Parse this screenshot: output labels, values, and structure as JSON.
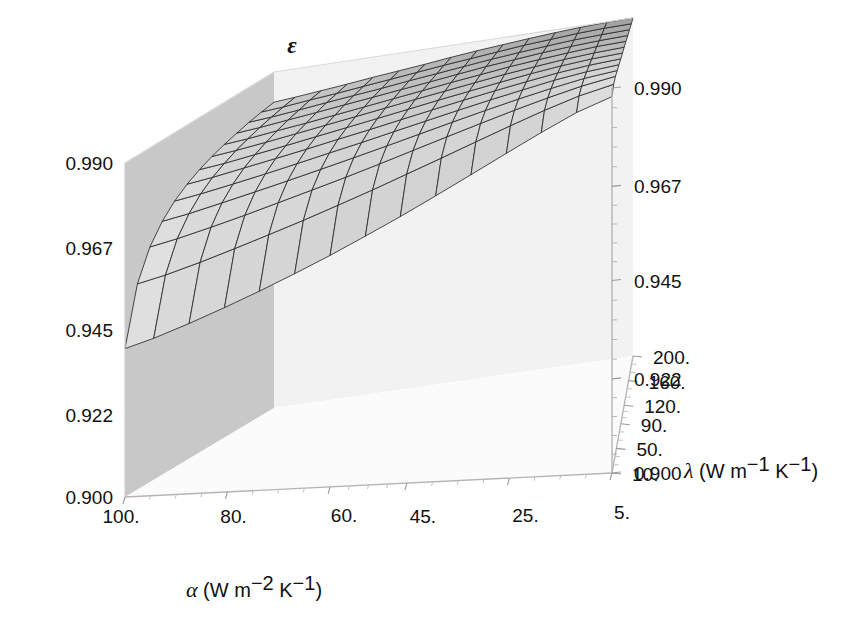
{
  "figure": {
    "kind": "surface-plot-3d",
    "background": "#ffffff",
    "ink": "#111111"
  },
  "vertical_axis": {
    "name": "epsilon",
    "label": "ε",
    "ticks_left": [
      "0.990",
      "0.967",
      "0.945",
      "0.922",
      "0.900"
    ],
    "ticks_right": [
      "0.990",
      "0.967",
      "0.945",
      "0.922",
      "0.900"
    ]
  },
  "alpha_axis": {
    "label_symbol": "α",
    "label_unit_open": " (W m",
    "label_unit_sup1": "−2",
    "label_unit_mid": " K",
    "label_unit_sup2": "−1",
    "label_unit_close": ")",
    "label_full": "α (W m−2 K−1)",
    "ticks": [
      "100.",
      "80.",
      "60.",
      "45.",
      "25.",
      "5."
    ]
  },
  "lambda_axis": {
    "label_symbol": "λ",
    "label_unit_open": " (W m",
    "label_unit_sup1": "−1",
    "label_unit_mid": " K",
    "label_unit_sup2": "−1",
    "label_unit_close": ")",
    "label_full": "λ (W m−1 K−1)",
    "ticks": [
      "200.",
      "160.",
      "120.",
      "90.",
      "50.",
      "10."
    ]
  },
  "chart_data": {
    "type": "surface",
    "title": "",
    "xlabel": "α (W m−2 K−1)",
    "ylabel": "λ (W m−1 K−1)",
    "zlabel": "ε",
    "xlim": [
      5,
      100
    ],
    "ylim": [
      10,
      200
    ],
    "zlim": [
      0.9,
      0.99
    ],
    "grid": true,
    "legend": "none",
    "colormap": "grayscale",
    "x_ticks": [
      100,
      80,
      60,
      45,
      25,
      5
    ],
    "y_ticks": [
      200,
      160,
      120,
      90,
      50,
      10
    ],
    "z_ticks": [
      0.99,
      0.967,
      0.945,
      0.922,
      0.9
    ],
    "x_name": "alpha",
    "y_name": "lambda",
    "z_name": "epsilon",
    "mesh_nx": 17,
    "mesh_ny": 13,
    "note": "epsilon rises toward high lambda and low alpha; steep drop at low lambda / high alpha corner",
    "x": [
      5,
      11.9,
      18.8,
      25.6,
      32.5,
      39.4,
      46.3,
      53.1,
      60,
      66.9,
      73.8,
      80.6,
      87.5,
      94.4,
      100
    ],
    "y": [
      10,
      25.8,
      41.7,
      57.5,
      73.3,
      89.2,
      105,
      120.8,
      136.7,
      152.5,
      168.3,
      184.2,
      200
    ],
    "z": [
      [
        0.988,
        0.9855,
        0.982,
        0.9782,
        0.9742,
        0.9702,
        0.9662,
        0.9624,
        0.9586,
        0.955,
        0.9515,
        0.9482,
        0.945,
        0.942,
        0.94
      ],
      [
        0.9895,
        0.988,
        0.9858,
        0.9833,
        0.9806,
        0.9778,
        0.975,
        0.9722,
        0.9695,
        0.9668,
        0.9642,
        0.9617,
        0.9592,
        0.9569,
        0.9554
      ],
      [
        0.99,
        0.9889,
        0.9873,
        0.9855,
        0.9835,
        0.9814,
        0.9792,
        0.977,
        0.9748,
        0.9727,
        0.9706,
        0.9685,
        0.9665,
        0.9646,
        0.9633
      ],
      [
        0.99,
        0.9893,
        0.9881,
        0.9867,
        0.9851,
        0.9834,
        0.9816,
        0.9798,
        0.978,
        0.9762,
        0.9744,
        0.9727,
        0.971,
        0.9693,
        0.9682
      ],
      [
        0.99,
        0.9895,
        0.9886,
        0.9874,
        0.9861,
        0.9847,
        0.9832,
        0.9817,
        0.9801,
        0.9786,
        0.977,
        0.9755,
        0.974,
        0.9726,
        0.9716
      ],
      [
        0.99,
        0.9896,
        0.9889,
        0.9879,
        0.9868,
        0.9856,
        0.9843,
        0.983,
        0.9816,
        0.9803,
        0.9789,
        0.9776,
        0.9763,
        0.975,
        0.9741
      ],
      [
        0.99,
        0.9897,
        0.9891,
        0.9883,
        0.9873,
        0.9862,
        0.9851,
        0.9839,
        0.9827,
        0.9815,
        0.9803,
        0.9791,
        0.9779,
        0.9767,
        0.976
      ],
      [
        0.99,
        0.9897,
        0.9892,
        0.9885,
        0.9877,
        0.9867,
        0.9857,
        0.9847,
        0.9836,
        0.9825,
        0.9814,
        0.9803,
        0.9792,
        0.9782,
        0.9775
      ],
      [
        0.99,
        0.9898,
        0.9893,
        0.9887,
        0.988,
        0.9871,
        0.9862,
        0.9852,
        0.9842,
        0.9832,
        0.9822,
        0.9812,
        0.9803,
        0.9793,
        0.9787
      ],
      [
        0.99,
        0.9898,
        0.9894,
        0.9889,
        0.9882,
        0.9875,
        0.9866,
        0.9857,
        0.9848,
        0.9839,
        0.983,
        0.9821,
        0.9812,
        0.9803,
        0.9797
      ],
      [
        0.99,
        0.9898,
        0.9895,
        0.989,
        0.9884,
        0.9877,
        0.9869,
        0.9861,
        0.9853,
        0.9844,
        0.9836,
        0.9828,
        0.9819,
        0.9811,
        0.9806
      ],
      [
        0.99,
        0.9899,
        0.9896,
        0.9891,
        0.9886,
        0.9879,
        0.9872,
        0.9865,
        0.9857,
        0.9849,
        0.9841,
        0.9833,
        0.9826,
        0.9818,
        0.9813
      ],
      [
        0.99,
        0.9899,
        0.9896,
        0.9892,
        0.9887,
        0.9881,
        0.9875,
        0.9868,
        0.986,
        0.9853,
        0.9846,
        0.9838,
        0.9831,
        0.9824,
        0.9819
      ]
    ]
  }
}
